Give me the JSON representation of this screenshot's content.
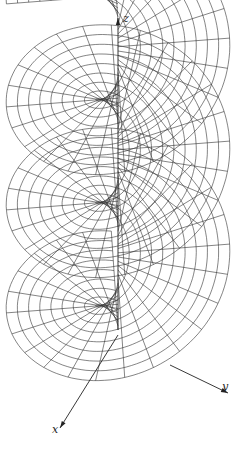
{
  "figure": {
    "type": "helicoid surface wireframe",
    "stroke_color": "#333333",
    "background": "#ffffff",
    "turns": 3.25,
    "radial_lines_per_turn": 24,
    "concentric_rings": 10,
    "surface": {
      "origin_screen": [
        118,
        330
      ],
      "radius_scale": 100,
      "pitch_per_turn": 103,
      "theta_start_deg": 210,
      "x_axis_dir": [
        -0.5,
        0.9
      ],
      "y_axis_dir": [
        1.0,
        0.42
      ]
    }
  },
  "axes": {
    "x": {
      "label": "x",
      "from": [
        118,
        335
      ],
      "to": [
        60,
        428
      ],
      "label_pos": [
        52,
        424
      ]
    },
    "y": {
      "label": "y",
      "from": [
        170,
        365
      ],
      "to": [
        228,
        393
      ],
      "label_pos": [
        222,
        381
      ]
    },
    "z": {
      "label": "z",
      "from": [
        118,
        330
      ],
      "to": [
        118,
        18
      ],
      "label_pos": [
        123,
        13
      ]
    }
  }
}
